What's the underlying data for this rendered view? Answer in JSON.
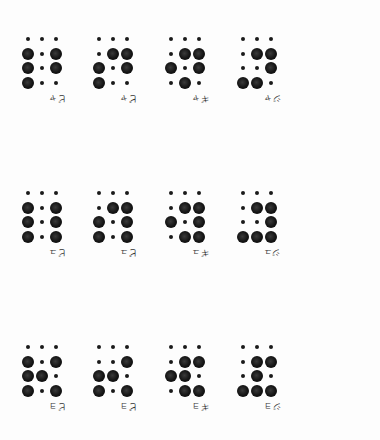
{
  "page": {
    "orientation": "upside-down",
    "background": "#fdfdfd",
    "dot_color": "#111111"
  },
  "rows": [
    {
      "name": "row-ya",
      "cells": [
        {
          "label": "ビャ",
          "pattern": [
            [
              0,
              0,
              0
            ],
            [
              1,
              0,
              1
            ],
            [
              1,
              0,
              1
            ],
            [
              1,
              0,
              0
            ]
          ]
        },
        {
          "label": "ピャ",
          "pattern": [
            [
              0,
              0,
              0
            ],
            [
              0,
              1,
              1
            ],
            [
              1,
              0,
              1
            ],
            [
              1,
              0,
              0
            ]
          ]
        },
        {
          "label": "ギャ",
          "pattern": [
            [
              0,
              0,
              0
            ],
            [
              0,
              1,
              1
            ],
            [
              1,
              0,
              1
            ],
            [
              0,
              1,
              0
            ]
          ]
        },
        {
          "label": "ジャ",
          "pattern": [
            [
              0,
              0,
              0
            ],
            [
              0,
              1,
              1
            ],
            [
              0,
              0,
              1
            ],
            [
              1,
              1,
              0
            ]
          ]
        }
      ]
    },
    {
      "name": "row-yu",
      "cells": [
        {
          "label": "ビュ",
          "pattern": [
            [
              0,
              0,
              0
            ],
            [
              1,
              0,
              1
            ],
            [
              1,
              0,
              1
            ],
            [
              1,
              0,
              1
            ]
          ]
        },
        {
          "label": "ピュ",
          "pattern": [
            [
              0,
              0,
              0
            ],
            [
              0,
              1,
              1
            ],
            [
              1,
              0,
              1
            ],
            [
              1,
              0,
              1
            ]
          ]
        },
        {
          "label": "ギュ",
          "pattern": [
            [
              0,
              0,
              0
            ],
            [
              0,
              1,
              1
            ],
            [
              1,
              0,
              1
            ],
            [
              0,
              1,
              1
            ]
          ]
        },
        {
          "label": "ジュ",
          "pattern": [
            [
              0,
              0,
              0
            ],
            [
              0,
              1,
              1
            ],
            [
              0,
              0,
              1
            ],
            [
              1,
              1,
              1
            ]
          ]
        }
      ]
    },
    {
      "name": "row-yo",
      "cells": [
        {
          "label": "ビョ",
          "pattern": [
            [
              0,
              0,
              0
            ],
            [
              1,
              0,
              1
            ],
            [
              1,
              1,
              0
            ],
            [
              1,
              0,
              1
            ]
          ]
        },
        {
          "label": "ピョ",
          "pattern": [
            [
              0,
              0,
              0
            ],
            [
              0,
              0,
              1
            ],
            [
              1,
              1,
              0
            ],
            [
              1,
              0,
              1
            ]
          ]
        },
        {
          "label": "ギョ",
          "pattern": [
            [
              0,
              0,
              0
            ],
            [
              0,
              1,
              1
            ],
            [
              1,
              1,
              0
            ],
            [
              0,
              1,
              1
            ]
          ]
        },
        {
          "label": "ジョ",
          "pattern": [
            [
              0,
              0,
              0
            ],
            [
              0,
              1,
              1
            ],
            [
              0,
              1,
              0
            ],
            [
              1,
              1,
              1
            ]
          ]
        }
      ]
    }
  ],
  "layout": {
    "cell_x": [
      28,
      99,
      171,
      243
    ],
    "row_y": [
      39,
      193,
      347
    ],
    "dot_dx": 14,
    "dot_dy": 14.5
  }
}
